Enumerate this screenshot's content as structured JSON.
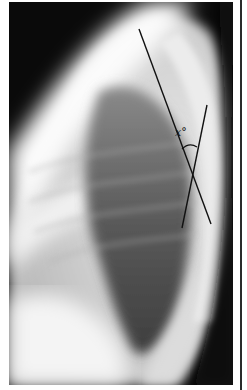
{
  "figure": {
    "angle_label": "x°",
    "colors": {
      "background": "#0a0a0a",
      "line": "#111111",
      "border": "#ffffff",
      "side_rule": "#2a2a2a"
    },
    "annotation": {
      "line_a": {
        "x1": 130,
        "y1": 27,
        "x2": 202,
        "y2": 222
      },
      "line_b": {
        "x1": 198,
        "y1": 103,
        "x2": 173,
        "y2": 226
      },
      "arc": {
        "cx": 180,
        "cy": 152,
        "r": 16
      },
      "label_pos": {
        "left": 173,
        "top": 126
      }
    }
  }
}
